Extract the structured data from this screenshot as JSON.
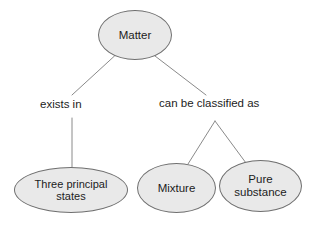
{
  "diagram": {
    "type": "concept-map",
    "background_color": "#ffffff",
    "node_fill_color": "#e9e9e9",
    "node_border_color": "#6f6f6f",
    "text_color": "#1c1c1c",
    "connector_color": "#8a8a8a",
    "nodes": [
      {
        "id": "matter",
        "label": "Matter",
        "shape": "ellipse",
        "level": 0
      },
      {
        "id": "three_principal_states",
        "label": "Three principal\nstates",
        "shape": "ellipse",
        "level": 2
      },
      {
        "id": "mixture",
        "label": "Mixture",
        "shape": "ellipse",
        "level": 2
      },
      {
        "id": "pure_substance",
        "label": "Pure\nsubstance",
        "shape": "ellipse",
        "level": 2
      }
    ],
    "edge_labels": [
      {
        "id": "exists_in",
        "label": "exists in",
        "from": "matter",
        "to": "three_principal_states"
      },
      {
        "id": "can_be_classified_as",
        "label": "can be classified as",
        "from": "matter",
        "to": [
          "mixture",
          "pure_substance"
        ]
      }
    ]
  }
}
